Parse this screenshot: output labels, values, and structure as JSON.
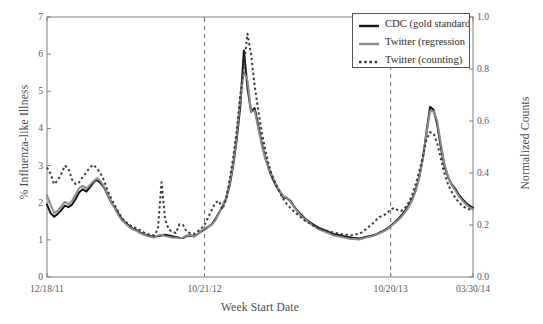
{
  "chart_data": {
    "type": "line",
    "title": "",
    "xlabel": "Week Start Date",
    "ylabel": "% Influenza-like Illness",
    "ylabel_right": "Normalized Counts",
    "grid": false,
    "legend_position": "top-right",
    "xlim": [
      0,
      120
    ],
    "ylim": [
      0,
      7
    ],
    "ylim_right": [
      0.0,
      1.0
    ],
    "y_ticks": [
      "0",
      "1",
      "2",
      "3",
      "4",
      "5",
      "6",
      "7"
    ],
    "y_ticks_right": [
      "0.0",
      "0.2",
      "0.4",
      "0.6",
      "0.8",
      "1.0"
    ],
    "x_tick_labels": [
      "12/18/11",
      "10/21/12",
      "10/20/13",
      "03/30/14"
    ],
    "x_tick_positions": [
      0,
      44,
      96,
      119
    ],
    "annotations": [
      {
        "name": "season-divider-2012",
        "type": "vline",
        "x": 44,
        "style": "dashed"
      },
      {
        "name": "season-divider-2013",
        "type": "vline",
        "x": 96,
        "style": "dashed"
      }
    ],
    "colors": {
      "cdc": "#151515",
      "twitter_regression": "#8c8c8c",
      "twitter_counting": "#3c3c3c",
      "axis": "#808080",
      "background": "#ffffff"
    },
    "series": [
      {
        "name": "CDC (gold standard)",
        "key": "cdc",
        "style": "solid",
        "color": "#151515",
        "width": 2.0,
        "values": [
          1.95,
          1.72,
          1.62,
          1.7,
          1.8,
          1.92,
          1.88,
          1.95,
          2.1,
          2.28,
          2.36,
          2.3,
          2.42,
          2.55,
          2.62,
          2.52,
          2.4,
          2.2,
          2.0,
          1.86,
          1.7,
          1.55,
          1.45,
          1.38,
          1.3,
          1.26,
          1.2,
          1.15,
          1.12,
          1.1,
          1.08,
          1.1,
          1.12,
          1.14,
          1.12,
          1.1,
          1.08,
          1.06,
          1.05,
          1.1,
          1.12,
          1.1,
          1.15,
          1.22,
          1.28,
          1.35,
          1.42,
          1.55,
          1.72,
          1.9,
          2.1,
          2.45,
          3.0,
          3.7,
          4.6,
          6.1,
          5.1,
          4.45,
          4.55,
          4.1,
          3.6,
          3.2,
          2.9,
          2.65,
          2.45,
          2.3,
          2.15,
          2.12,
          2.05,
          1.9,
          1.78,
          1.68,
          1.58,
          1.5,
          1.44,
          1.38,
          1.32,
          1.28,
          1.24,
          1.2,
          1.16,
          1.14,
          1.12,
          1.1,
          1.08,
          1.06,
          1.05,
          1.04,
          1.05,
          1.08,
          1.1,
          1.12,
          1.15,
          1.2,
          1.24,
          1.3,
          1.38,
          1.46,
          1.55,
          1.66,
          1.78,
          1.92,
          2.1,
          2.35,
          2.7,
          3.2,
          3.9,
          4.58,
          4.5,
          4.1,
          3.5,
          3.0,
          2.7,
          2.5,
          2.38,
          2.22,
          2.1,
          2.0,
          1.92,
          1.86
        ]
      },
      {
        "name": "Twitter (regression",
        "key": "twitter_regression",
        "style": "solid",
        "color": "#8c8c8c",
        "width": 2.0,
        "values": [
          2.2,
          1.95,
          1.72,
          1.78,
          1.9,
          2.02,
          1.96,
          2.05,
          2.22,
          2.4,
          2.45,
          2.38,
          2.48,
          2.58,
          2.66,
          2.58,
          2.42,
          2.22,
          2.02,
          1.84,
          1.66,
          1.52,
          1.44,
          1.34,
          1.28,
          1.24,
          1.18,
          1.14,
          1.1,
          1.08,
          1.06,
          1.12,
          1.14,
          1.1,
          1.08,
          1.06,
          1.06,
          1.04,
          1.06,
          1.12,
          1.14,
          1.08,
          1.14,
          1.24,
          1.3,
          1.36,
          1.4,
          1.52,
          1.7,
          1.92,
          2.12,
          2.5,
          3.05,
          3.8,
          4.8,
          5.52,
          5.3,
          4.45,
          4.48,
          4.02,
          3.55,
          3.18,
          2.92,
          2.7,
          2.48,
          2.32,
          2.18,
          2.14,
          2.02,
          1.88,
          1.76,
          1.64,
          1.56,
          1.48,
          1.4,
          1.34,
          1.28,
          1.24,
          1.2,
          1.16,
          1.12,
          1.1,
          1.08,
          1.06,
          1.04,
          1.02,
          1.02,
          1.01,
          1.03,
          1.06,
          1.08,
          1.1,
          1.14,
          1.18,
          1.22,
          1.28,
          1.36,
          1.44,
          1.52,
          1.62,
          1.74,
          1.88,
          2.06,
          2.32,
          2.68,
          3.18,
          3.86,
          4.46,
          4.46,
          4.2,
          3.6,
          3.05,
          2.72,
          2.48,
          2.34,
          2.18,
          2.06,
          1.96,
          1.88,
          1.82
        ]
      },
      {
        "name": "Twitter (counting)",
        "key": "twitter_counting",
        "style": "dotted",
        "color": "#3c3c3c",
        "width": 2.0,
        "values": [
          2.95,
          2.78,
          2.5,
          2.6,
          2.78,
          3.0,
          2.92,
          2.62,
          2.5,
          2.55,
          2.7,
          2.82,
          2.95,
          3.02,
          2.92,
          2.78,
          2.58,
          2.3,
          2.1,
          1.92,
          1.74,
          1.58,
          1.48,
          1.4,
          1.34,
          1.32,
          1.26,
          1.2,
          1.16,
          1.14,
          1.12,
          1.3,
          2.55,
          1.55,
          1.28,
          1.22,
          1.18,
          1.42,
          1.4,
          1.22,
          1.18,
          1.16,
          1.22,
          1.3,
          1.4,
          1.6,
          1.8,
          2.0,
          2.05,
          1.82,
          2.08,
          2.6,
          3.2,
          3.95,
          4.9,
          5.7,
          6.55,
          6.0,
          5.15,
          4.5,
          3.9,
          3.4,
          3.0,
          2.7,
          2.48,
          2.28,
          2.1,
          1.96,
          1.86,
          1.76,
          1.68,
          1.6,
          1.52,
          1.46,
          1.4,
          1.36,
          1.3,
          1.28,
          1.25,
          1.22,
          1.2,
          1.18,
          1.16,
          1.14,
          1.14,
          1.12,
          1.14,
          1.16,
          1.2,
          1.28,
          1.36,
          1.44,
          1.54,
          1.62,
          1.66,
          1.72,
          1.82,
          1.86,
          1.8,
          1.78,
          1.86,
          2.0,
          2.2,
          2.5,
          2.85,
          3.25,
          3.7,
          3.9,
          3.86,
          3.6,
          3.2,
          2.8,
          2.5,
          2.3,
          2.14,
          2.02,
          1.92,
          1.86,
          1.82,
          1.8
        ]
      }
    ]
  },
  "legend": {
    "items": [
      {
        "label": "CDC (gold standard)",
        "swatch": "solid-dark"
      },
      {
        "label": "Twitter (regression",
        "swatch": "solid-gray"
      },
      {
        "label": "Twitter (counting)",
        "swatch": "dotted-dark"
      }
    ]
  }
}
